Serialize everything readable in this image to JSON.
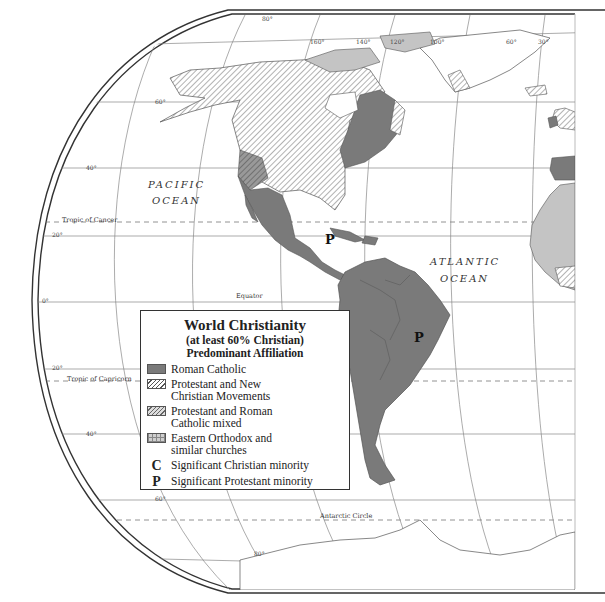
{
  "map": {
    "title": "World Christianity",
    "subtitle_1": "(at least 60% Christian)",
    "subtitle_2": "Predominant Affiliation",
    "legend": [
      {
        "key": "roman-catholic",
        "label": "Roman Catholic",
        "swatch": "solid-dark-gray"
      },
      {
        "key": "protestant",
        "label_1": "Protestant and New",
        "label_2": "Christian Movements",
        "swatch": "diagonal-hatch"
      },
      {
        "key": "mixed",
        "label_1": "Protestant and Roman",
        "label_2": "Catholic mixed",
        "swatch": "diagonal-hatch-gray"
      },
      {
        "key": "orthodox",
        "label_1": "Eastern Orthodox and",
        "label_2": "similar churches",
        "swatch": "grid"
      },
      {
        "key": "christian-minority",
        "symbol": "C",
        "label": "Significant Christian minority"
      },
      {
        "key": "protestant-minority",
        "symbol": "P",
        "label": "Significant Protestant minority"
      }
    ],
    "labels": {
      "pacific_1": "PACIFIC",
      "pacific_2": "OCEAN",
      "atlantic_1": "ATLANTIC",
      "atlantic_2": "OCEAN",
      "tropic_cancer": "Tropic of Cancer",
      "tropic_capricorn": "Tropic of Capricorn",
      "equator": "Equator",
      "antarctic_circle": "Antarctic Circle",
      "marker_caribbean": "P",
      "marker_brazil": "P"
    },
    "latitudes": [
      "80°",
      "60°",
      "40°",
      "20°",
      "0°",
      "20°",
      "40°",
      "60°",
      "80°"
    ],
    "longitudes": [
      "160°",
      "140°",
      "120°",
      "100°",
      "60°",
      "20°"
    ],
    "colors": {
      "roman_catholic": "#7a7a7a",
      "orthodox_light": "#c4c4c4",
      "line": "#555555",
      "border": "#333333"
    }
  }
}
